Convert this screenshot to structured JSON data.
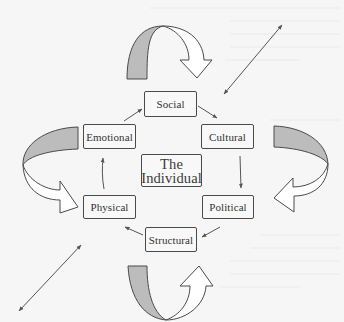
{
  "diagram": {
    "title": "The Individual",
    "center": {
      "line1": "The",
      "line2": "Individual"
    },
    "nodes": [
      {
        "id": "social",
        "label": "Social"
      },
      {
        "id": "cultural",
        "label": "Cultural"
      },
      {
        "id": "political",
        "label": "Political"
      },
      {
        "id": "structural",
        "label": "Structural"
      },
      {
        "id": "physical",
        "label": "Physical"
      },
      {
        "id": "emotional",
        "label": "Emotional"
      }
    ],
    "edges": [
      {
        "from": "Emotional",
        "to": "Social"
      },
      {
        "from": "Social",
        "to": "Cultural"
      },
      {
        "from": "Cultural",
        "to": "Political"
      },
      {
        "from": "Political",
        "to": "Structural"
      },
      {
        "from": "Structural",
        "to": "Physical"
      },
      {
        "from": "Physical",
        "to": "Emotional"
      }
    ],
    "curved_arrows": [
      {
        "position": "top",
        "direction": "clockwise"
      },
      {
        "position": "right",
        "direction": "clockwise"
      },
      {
        "position": "bottom",
        "direction": "counterclockwise"
      },
      {
        "position": "left",
        "direction": "counterclockwise"
      }
    ],
    "double_arrows": [
      {
        "position": "top-right"
      },
      {
        "position": "bottom-left"
      }
    ],
    "colors": {
      "background": "#f6f6f6",
      "stroke": "#4a4a4a",
      "arrow_fill_shaded": "#bcbcbc",
      "arrow_fill_light": "#ffffff",
      "text": "#333333"
    }
  }
}
